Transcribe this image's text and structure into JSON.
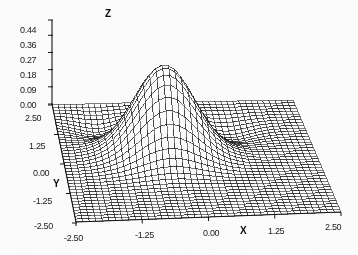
{
  "figure": {
    "kind": "3d-surface-wireframe",
    "background": "#ffffff",
    "ink": "#141414"
  },
  "axes": {
    "z": {
      "name": "Z",
      "ticks": [
        "0.44",
        "0.36",
        "0.27",
        "0.18",
        "0.09",
        "0.00"
      ]
    },
    "y": {
      "name": "Y",
      "ticks": [
        "2.50",
        "1.25",
        "0.00",
        "-1.25",
        "-2.50"
      ]
    },
    "x": {
      "name": "X",
      "ticks": [
        "-2.50",
        "-1.25",
        "0.00",
        "1.25",
        "2.50"
      ]
    }
  },
  "chart_data": {
    "type": "surface",
    "title": "",
    "xlabel": "X",
    "ylabel": "Y",
    "zlabel": "Z",
    "xlim": [
      -2.5,
      2.5
    ],
    "ylim": [
      -2.5,
      2.5
    ],
    "zlim": [
      0.0,
      0.44
    ],
    "xticks": [
      -2.5,
      -1.25,
      0.0,
      1.25,
      2.5
    ],
    "yticks": [
      -2.5,
      -1.25,
      0.0,
      1.25,
      2.5
    ],
    "zticks": [
      0.0,
      0.09,
      0.18,
      0.27,
      0.36,
      0.44
    ],
    "grid": true,
    "legend": false,
    "mesh": {
      "nx": 40,
      "ny": 40,
      "style": "black-wireframe",
      "hidden_line_removal": true
    },
    "view": {
      "azimuth_deg": -52,
      "elevation_deg": 24,
      "projection": "oblique"
    },
    "peak": {
      "x": -0.45,
      "y": 0.45,
      "z": 0.44
    },
    "dips": [
      {
        "x": -1.6,
        "y": 1.5,
        "z": -0.05
      },
      {
        "x": 0.85,
        "y": 1.2,
        "z": -0.05
      }
    ],
    "surface_function": "0.44*exp(-((x+0.45)^2+(y-0.45)^2)/0.70) - 0.055*exp(-((x+1.6)^2+(y-1.5)^2)/0.36) - 0.055*exp(-((x-0.85)^2+(y-1.2)^2)/0.40)"
  }
}
